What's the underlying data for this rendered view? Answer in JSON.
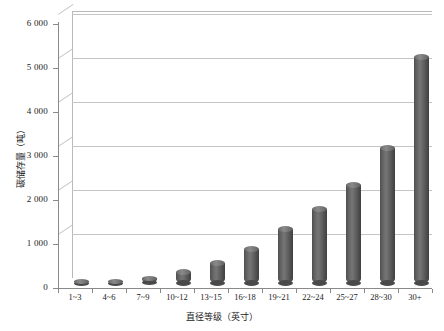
{
  "chart_data": {
    "type": "bar",
    "title": "",
    "subtitle": "",
    "xlabel": "直径等级（英寸）",
    "ylabel": "碳储存量（吨）",
    "categories": [
      "1~3",
      "4~6",
      "7~9",
      "10~12",
      "13~15",
      "16~18",
      "19~21",
      "22~24",
      "25~27",
      "28~30",
      "30+"
    ],
    "values": [
      30,
      45,
      120,
      270,
      470,
      780,
      1230,
      1690,
      2240,
      3080,
      5150
    ],
    "ylim": [
      0,
      6000
    ],
    "ytick_values": [
      0,
      1000,
      2000,
      3000,
      4000,
      5000,
      6000
    ],
    "ytick_labels": [
      "0",
      "1 000",
      "2 000",
      "3 000",
      "4 000",
      "5 000",
      "6 000"
    ],
    "grid": true,
    "legend": "none",
    "series_color": "#5a5a5a",
    "style": "3d-cylinder",
    "background": "#ffffff",
    "gridline_color": "#c5c5c5",
    "axis_color": "#8a8a8a"
  }
}
